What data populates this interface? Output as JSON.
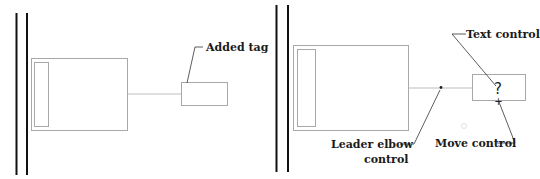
{
  "left_panel": {
    "tag_label": "Added tag"
  },
  "right_panel": {
    "tag_glyph": "?",
    "move_glyph": "+",
    "callouts": {
      "text_control": "Text control",
      "leader_elbow_line1": "Leader elbow",
      "leader_elbow_line2": "control",
      "move_control": "Move control"
    }
  },
  "colors": {
    "wall": "#111111",
    "outline": "#a8a8a8",
    "leader": "#bdbdbd",
    "callout_line": "#333333",
    "text": "#1a1a1a"
  }
}
